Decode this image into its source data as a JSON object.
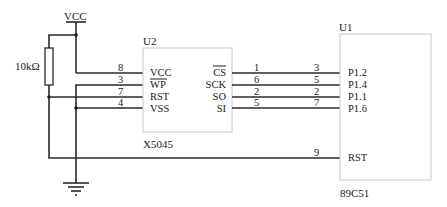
{
  "power": {
    "label": "VCC"
  },
  "resistor": {
    "label": "10kΩ"
  },
  "u2": {
    "ref": "U2",
    "part": "X5045",
    "left_pins": [
      {
        "name": "VCC",
        "number": "8",
        "active_low": false
      },
      {
        "name": "WP",
        "number": "3",
        "active_low": true
      },
      {
        "name": "RST",
        "number": "7",
        "active_low": false
      },
      {
        "name": "VSS",
        "number": "4",
        "active_low": false
      }
    ],
    "right_pins": [
      {
        "name": "CS",
        "number": "1",
        "active_low": true
      },
      {
        "name": "SCK",
        "number": "6",
        "active_low": false
      },
      {
        "name": "SO",
        "number": "2",
        "active_low": false
      },
      {
        "name": "SI",
        "number": "5",
        "active_low": false
      }
    ]
  },
  "u1": {
    "ref": "U1",
    "part": "89C51",
    "left_pins": [
      {
        "name": "P1.2",
        "number": "3"
      },
      {
        "name": "P1.4",
        "number": "5"
      },
      {
        "name": "P1.1",
        "number": "2"
      },
      {
        "name": "P1.6",
        "number": "7"
      },
      {
        "name": "RST",
        "number": "9"
      }
    ]
  },
  "ground": {
    "symbol": "ground-icon"
  }
}
